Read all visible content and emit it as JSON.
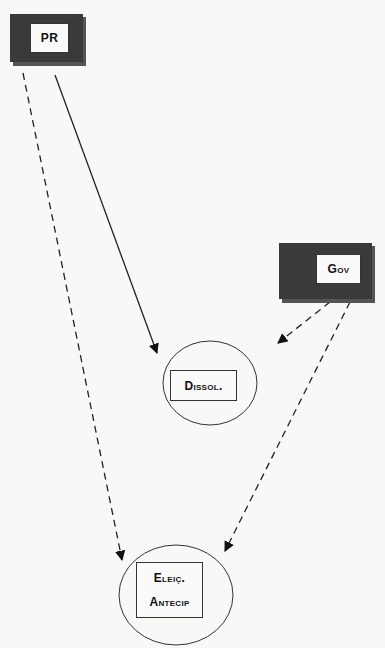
{
  "diagram": {
    "nodes": {
      "pr": {
        "label": "PR",
        "shape": "dark-framed-box"
      },
      "gov": {
        "label": "Gov",
        "shape": "dark-framed-box"
      },
      "dissol": {
        "label": "Dissol.",
        "shape": "circle-with-box"
      },
      "eleic": {
        "label_line1": "Eleiç.",
        "label_line2": "Antecip",
        "shape": "circle-with-box"
      }
    },
    "edges": [
      {
        "from": "PR",
        "to": "Dissol.",
        "style": "solid"
      },
      {
        "from": "PR",
        "to": "Eleiç. Antecip",
        "style": "dashed"
      },
      {
        "from": "Gov",
        "to": "Dissol.",
        "style": "dashed"
      },
      {
        "from": "Gov",
        "to": "Eleiç. Antecip",
        "style": "dashed"
      }
    ],
    "colors": {
      "background": "#f8f8f6",
      "frame": "#3a3a3a",
      "frame_shadow": "#555555",
      "line": "#222222"
    }
  }
}
